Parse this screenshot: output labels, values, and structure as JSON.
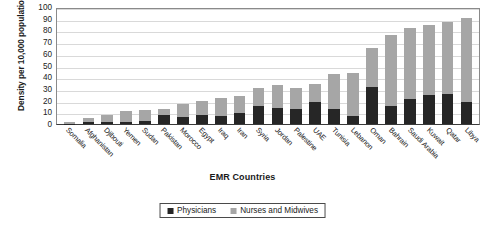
{
  "chart_data": {
    "type": "bar",
    "subtype": "stacked-bar",
    "title": "",
    "xlabel": "EMR Countries",
    "ylabel": "Density per 10,000 population",
    "ylim": [
      0,
      100
    ],
    "yticks": [
      0,
      10,
      20,
      30,
      40,
      50,
      60,
      70,
      80,
      90,
      100
    ],
    "grid": true,
    "legend_position": "bottom-center",
    "categories": [
      "Somalia",
      "Afghanistan",
      "Djibouti",
      "Yemen",
      "Sudan",
      "Pakistan",
      "Morocco",
      "Egypt",
      "Iraq",
      "Iran",
      "Syria",
      "Jordan",
      "Palestine",
      "UAE",
      "Tunisia",
      "Lebanon",
      "Oman",
      "Bahrain",
      "Saudi Arabia",
      "Kuwait",
      "Qatar",
      "Libya"
    ],
    "series": [
      {
        "name": "Physicians",
        "color": "#262626",
        "values": [
          0.4,
          2,
          2,
          2,
          3,
          8,
          6,
          8,
          7,
          9,
          15,
          14,
          13,
          19,
          13,
          7,
          32,
          15,
          21,
          25,
          26,
          19
        ]
      },
      {
        "name": "Nurses and Midwives",
        "color": "#a6a6a6",
        "values": [
          1.1,
          3,
          6,
          9,
          9,
          5,
          11,
          12,
          15,
          15,
          16,
          19,
          18,
          15,
          30,
          37,
          33,
          61,
          61,
          60,
          61,
          72
        ]
      }
    ],
    "totals": [
      1.5,
      5,
      8,
      11,
      12,
      13,
      17,
      20,
      22,
      24,
      31,
      33,
      31,
      34,
      43,
      44,
      65,
      76,
      82,
      85,
      87,
      91
    ]
  },
  "legend": {
    "items": [
      {
        "label": "Physicians",
        "color": "#262626"
      },
      {
        "label": "Nurses and Midwives",
        "color": "#a6a6a6"
      }
    ]
  },
  "axis": {
    "y_title": "Density per 10,000 population",
    "x_title": "EMR Countries"
  }
}
